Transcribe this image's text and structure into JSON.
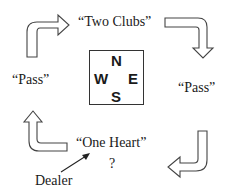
{
  "compass": {
    "north": "N",
    "west": "W",
    "east": "E",
    "south": "S"
  },
  "bids": {
    "north": "“Two Clubs”",
    "west": "“Pass”",
    "east": "“Pass”",
    "south": "“One Heart”"
  },
  "next_bid": "?",
  "dealer_label": "Dealer",
  "colors": {
    "ink": "#1a1a1a",
    "arrow_stroke": "#444444",
    "background": "#ffffff"
  }
}
